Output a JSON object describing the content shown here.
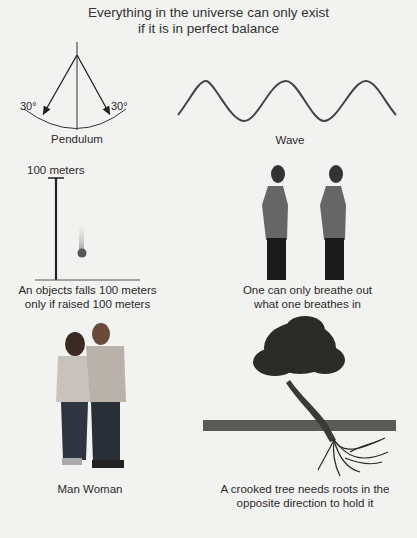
{
  "title_line1": "Everything in the universe can only exist",
  "title_line2": "if it is in perfect balance",
  "pendulum": {
    "angle_left": "30°",
    "angle_right": "30°",
    "caption": "Pendulum"
  },
  "wave": {
    "caption": "Wave"
  },
  "falling_object": {
    "height_label": "100 meters",
    "caption_line1": "An objects falls 100 meters",
    "caption_line2": "only if raised 100 meters"
  },
  "breathing": {
    "caption_line1": "One can only breathe out",
    "caption_line2": "what one breathes in"
  },
  "couple": {
    "caption": "Man  Woman"
  },
  "tree": {
    "caption_line1": "A crooked tree needs  roots in the",
    "caption_line2": "opposite direction to hold it"
  },
  "colors": {
    "background": "#f2f2f0",
    "ink": "#2a2a2a",
    "ground": "#5a5a58"
  }
}
